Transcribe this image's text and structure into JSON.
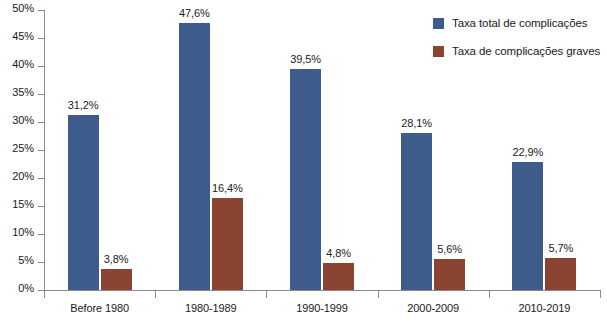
{
  "chart_data": {
    "type": "bar",
    "title": "",
    "subtitle": "",
    "xlabel": "",
    "ylabel": "",
    "ylim": [
      0,
      50
    ],
    "ytick_step": 5,
    "ytick_labels": [
      "0%",
      "5%",
      "10%",
      "15%",
      "20%",
      "25%",
      "30%",
      "35%",
      "40%",
      "45%",
      "50%"
    ],
    "ytick_values": [
      0,
      5,
      10,
      15,
      20,
      25,
      30,
      35,
      40,
      45,
      50
    ],
    "grid": false,
    "legend_position": "top-right",
    "decimal_separator": ",",
    "value_suffix": "%",
    "categories": [
      "Before 1980",
      "1980-1989",
      "1990-1999",
      "2000-2009",
      "2010-2019"
    ],
    "series": [
      {
        "name": "Taxa total de complicações",
        "color": "#3d5c8c",
        "values": [
          31.2,
          47.6,
          39.5,
          28.1,
          22.9
        ],
        "labels": [
          "31,2%",
          "47,6%",
          "39,5%",
          "28,1%",
          "22,9%"
        ]
      },
      {
        "name": "Taxa de complicações graves",
        "color": "#8b4332",
        "values": [
          3.8,
          16.4,
          4.8,
          5.6,
          5.7
        ],
        "labels": [
          "3,8%",
          "16,4%",
          "4,8%",
          "5,6%",
          "5,7%"
        ]
      }
    ]
  },
  "legend": {
    "items": [
      {
        "label": "Taxa total de complicações",
        "color": "#3d5c8c"
      },
      {
        "label": "Taxa de complicações graves",
        "color": "#8b4332"
      }
    ]
  },
  "colors": {
    "series_total": "#3d5c8c",
    "series_severe": "#8b4332",
    "axis": "#8a8a8a",
    "text": "#1a1a1a",
    "background": "#ffffff"
  }
}
